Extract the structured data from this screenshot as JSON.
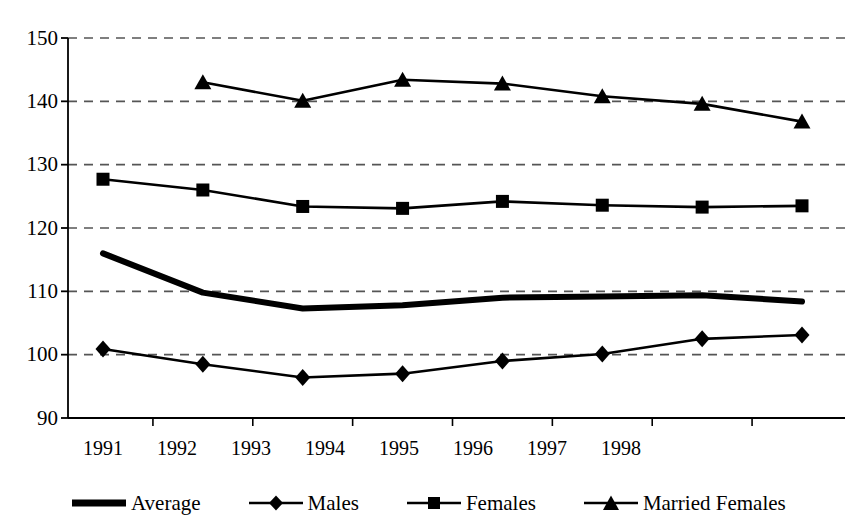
{
  "chart_data": {
    "type": "line",
    "title": "",
    "subtitle": "",
    "xlabel": "",
    "ylabel": "",
    "categories": [
      "1991",
      "1992",
      "1993",
      "1994",
      "1995",
      "1996",
      "1997",
      "1998"
    ],
    "ylim": [
      90,
      150
    ],
    "yticks": [
      90,
      100,
      110,
      120,
      130,
      140,
      150
    ],
    "ytick_labels": [
      "90",
      "100",
      "110",
      "120",
      "130",
      "140",
      "150"
    ],
    "grid": "horizontal-dashed",
    "legend_position": "bottom",
    "series": [
      {
        "name": "Average",
        "marker": "none",
        "line_width": 6,
        "color": "#000000",
        "values": [
          116.0,
          109.8,
          107.3,
          107.8,
          109.0,
          109.2,
          109.4,
          108.4
        ]
      },
      {
        "name": "Males",
        "marker": "diamond",
        "line_width": 2.6,
        "color": "#000000",
        "values": [
          100.9,
          98.5,
          96.4,
          97.0,
          99.0,
          100.1,
          102.5,
          103.1
        ]
      },
      {
        "name": "Females",
        "marker": "square",
        "line_width": 2.6,
        "color": "#000000",
        "values": [
          127.7,
          126.0,
          123.4,
          123.1,
          124.2,
          123.6,
          123.3,
          123.5
        ]
      },
      {
        "name": "Married Females",
        "marker": "triangle",
        "line_width": 2.6,
        "color": "#000000",
        "values": [
          null,
          143.0,
          140.1,
          143.4,
          142.8,
          140.8,
          139.6,
          136.8
        ]
      }
    ]
  },
  "legend": {
    "items": [
      {
        "label": "Average",
        "marker": "none"
      },
      {
        "label": "Males",
        "marker": "diamond"
      },
      {
        "label": "Females",
        "marker": "square"
      },
      {
        "label": "Married Females",
        "marker": "triangle"
      }
    ]
  },
  "axes": {
    "y_tick_labels": [
      "150",
      "140",
      "130",
      "120",
      "110",
      "100",
      "90"
    ],
    "x_tick_labels": [
      "1991",
      "1992",
      "1993",
      "1994",
      "1995",
      "1996",
      "1997",
      "1998"
    ]
  },
  "colors": {
    "ink": "#000000",
    "grid": "#555555",
    "background": "#ffffff"
  }
}
